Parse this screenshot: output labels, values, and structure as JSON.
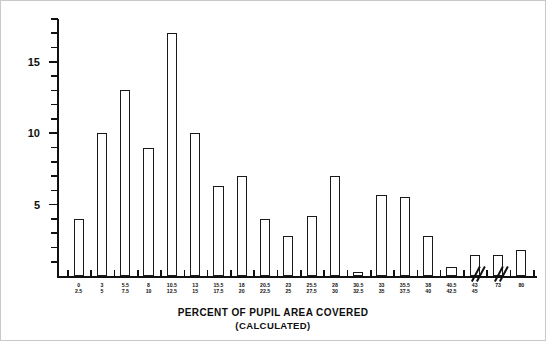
{
  "chart_data": {
    "type": "bar",
    "title": "",
    "xlabel": "PERCENT OF PUPIL AREA COVERED",
    "xlabel_sub": "(CALCULATED)",
    "ylabel": "FREQUENCY (# INDIVIDUALS)",
    "ylim": [
      0,
      18
    ],
    "ytick_interval": 1,
    "ytick_labels": [
      "5",
      "10",
      "15"
    ],
    "ytick_label_values": [
      5,
      10,
      15
    ],
    "grid": false,
    "legend": false,
    "axis_break_after_categories": [
      18,
      19
    ],
    "bar_style": "hollow-outline",
    "categories": [
      "0\n2.5",
      "3\n5",
      "5.5\n7.5",
      "8\n10",
      "10.5\n12.5",
      "13\n15",
      "15.5\n17.5",
      "18\n20",
      "20.5\n22.5",
      "23\n25",
      "25.5\n27.5",
      "28\n30",
      "30.5\n32.5",
      "33\n35",
      "35.5\n37.5",
      "38\n40",
      "40.5\n42.5",
      "43\n45",
      "73",
      "80"
    ],
    "category_lines": [
      [
        "0",
        "2.5"
      ],
      [
        "3",
        "5"
      ],
      [
        "5.5",
        "7.5"
      ],
      [
        "8",
        "10"
      ],
      [
        "10.5",
        "12.5"
      ],
      [
        "13",
        "15"
      ],
      [
        "15.5",
        "17.5"
      ],
      [
        "18",
        "20"
      ],
      [
        "20.5",
        "22.5"
      ],
      [
        "23",
        "25"
      ],
      [
        "25.5",
        "27.5"
      ],
      [
        "28",
        "30"
      ],
      [
        "30.5",
        "32.5"
      ],
      [
        "33",
        "35"
      ],
      [
        "35.5",
        "37.5"
      ],
      [
        "38",
        "40"
      ],
      [
        "40.5",
        "42.5"
      ],
      [
        "43",
        "45"
      ],
      [
        "73",
        ""
      ],
      [
        "80",
        ""
      ]
    ],
    "values": [
      4,
      10,
      13,
      9,
      17,
      10,
      6.3,
      7,
      4,
      2.8,
      4.2,
      7,
      0.3,
      5.7,
      5.5,
      2.8,
      0.6,
      1.5,
      1.5,
      1.8
    ],
    "ylabel_text": "FREQUENCY (# INDIVIDUALS)"
  },
  "axis": {
    "y_title": "FREQUENCY (# INDIVIDUALS)",
    "x_title_line1": "PERCENT OF PUPIL AREA COVERED",
    "x_title_line2": "(CALCULATED)"
  }
}
